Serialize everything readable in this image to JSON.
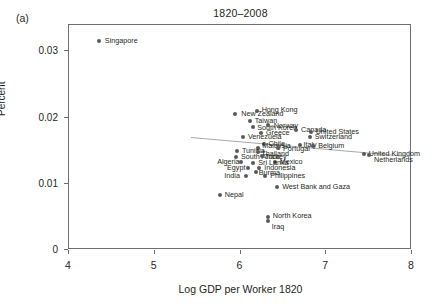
{
  "figure": {
    "panel_letter": "(a)",
    "title": "1820–2008",
    "xlabel": "Log GDP per Worker 1820",
    "ylabel": "Percent"
  },
  "axes": {
    "x_ticks": [
      "4",
      "5",
      "6",
      "7",
      "8"
    ],
    "y_ticks": [
      "0.03",
      "0.02",
      "0.01",
      "0"
    ]
  },
  "colors": {
    "marker": "#58595b",
    "axis": "#6d6e71",
    "trendline": "#a7a9ac",
    "text": "#231f20"
  },
  "chart_data": {
    "type": "scatter",
    "title": "1820–2008",
    "xlabel": "Log GDP per Worker 1820",
    "ylabel": "Percent",
    "xlim": [
      4,
      8
    ],
    "ylim": [
      0,
      0.034
    ],
    "grid": false,
    "legend": null,
    "trendline": {
      "visible": true,
      "x": [
        5.43,
        8.0
      ],
      "y": [
        0.01695,
        0.01405
      ],
      "note": "downward-sloping fitted line"
    },
    "points": [
      {
        "label": "Singapore",
        "x": 4.36,
        "y": 0.0315
      },
      {
        "label": "New Zealand",
        "x": 5.95,
        "y": 0.0204
      },
      {
        "label": "Hong Kong",
        "x": 6.2,
        "y": 0.0209
      },
      {
        "label": "Taiwan",
        "x": 6.12,
        "y": 0.0193
      },
      {
        "label": "Norway",
        "x": 6.33,
        "y": 0.0188
      },
      {
        "label": "South Korea",
        "x": 6.16,
        "y": 0.0185
      },
      {
        "label": "Greece",
        "x": 6.25,
        "y": 0.0176
      },
      {
        "label": "Canada",
        "x": 6.66,
        "y": 0.018
      },
      {
        "label": "United States",
        "x": 6.83,
        "y": 0.0177
      },
      {
        "label": "Switzerland",
        "x": 6.82,
        "y": 0.017
      },
      {
        "label": "Venezuela",
        "x": 6.04,
        "y": 0.0169
      },
      {
        "label": "Chile",
        "x": 6.28,
        "y": 0.0159
      },
      {
        "label": "Malaysia",
        "x": 6.22,
        "y": 0.0153
      },
      {
        "label": "Italy",
        "x": 6.7,
        "y": 0.0157
      },
      {
        "label": "Belgium",
        "x": 6.86,
        "y": 0.0156
      },
      {
        "label": "Portugal",
        "x": 6.45,
        "y": 0.0152
      },
      {
        "label": "Tunisia",
        "x": 5.97,
        "y": 0.0148
      },
      {
        "label": "Thailand",
        "x": 6.22,
        "y": 0.0147
      },
      {
        "label": "United Kingdom",
        "x": 7.45,
        "y": 0.0143
      },
      {
        "label": "Netherlands",
        "x": 7.51,
        "y": 0.0142
      },
      {
        "label": "South Africa",
        "x": 5.96,
        "y": 0.0139
      },
      {
        "label": "Turkey",
        "x": 6.26,
        "y": 0.014
      },
      {
        "label": "Algeria",
        "x": 6.02,
        "y": 0.0131
      },
      {
        "label": "Mexico",
        "x": 6.41,
        "y": 0.0132
      },
      {
        "label": "Sri Lanka",
        "x": 6.16,
        "y": 0.013
      },
      {
        "label": "Egypt",
        "x": 6.1,
        "y": 0.0123
      },
      {
        "label": "Indonesia",
        "x": 6.23,
        "y": 0.0122
      },
      {
        "label": "Burma",
        "x": 6.19,
        "y": 0.0116
      },
      {
        "label": "India",
        "x": 6.08,
        "y": 0.011
      },
      {
        "label": "Philippines",
        "x": 6.3,
        "y": 0.011
      },
      {
        "label": "West Bank and Gaza",
        "x": 6.44,
        "y": 0.0094
      },
      {
        "label": "Nepal",
        "x": 5.77,
        "y": 0.0082
      },
      {
        "label": "North Korea",
        "x": 6.33,
        "y": 0.0048
      },
      {
        "label": "Iraq",
        "x": 6.33,
        "y": 0.0043
      }
    ]
  }
}
